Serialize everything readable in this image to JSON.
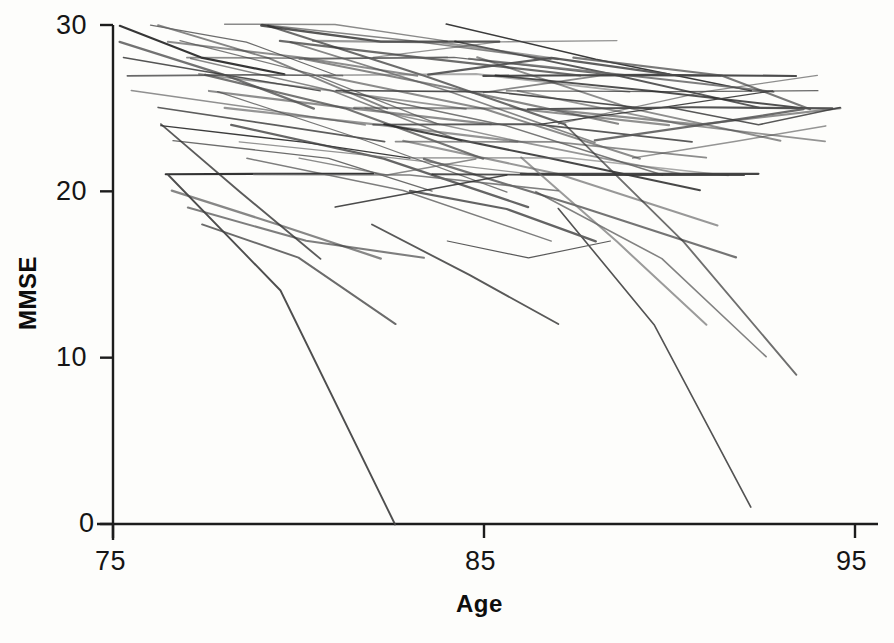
{
  "figure": {
    "background_color": "#fdfdfb",
    "line_color": "#3a3a3a"
  },
  "axes": {
    "x_title": "Age",
    "y_title": "MMSE",
    "x_ticks": [
      "75",
      "85",
      "95"
    ],
    "y_ticks": [
      "30",
      "20",
      "10",
      "0"
    ]
  },
  "chart_data": {
    "type": "line",
    "title": "",
    "subtitle": "",
    "xlabel": "Age",
    "ylabel": "MMSE",
    "xlim": [
      75,
      95
    ],
    "ylim": [
      0,
      30
    ],
    "xticks": [
      75,
      85,
      95
    ],
    "yticks": [
      0,
      10,
      20,
      30
    ],
    "grid": false,
    "legend": "none",
    "n_series": 80,
    "series": [
      {
        "name": "s1",
        "x": [
          75.2,
          77.4,
          79.6
        ],
        "values": [
          30,
          28,
          27
        ]
      },
      {
        "name": "s2",
        "x": [
          75.2,
          78.0,
          80.4
        ],
        "values": [
          29,
          27,
          25
        ]
      },
      {
        "name": "s3",
        "x": [
          75.3,
          77.9,
          80.6
        ],
        "values": [
          28,
          27,
          26
        ]
      },
      {
        "name": "s4",
        "x": [
          75.4,
          78.6,
          81.2
        ],
        "values": [
          27,
          27,
          27
        ]
      },
      {
        "name": "s5",
        "x": [
          75.5,
          79.0,
          81.8
        ],
        "values": [
          26,
          25,
          24
        ]
      },
      {
        "name": "s6",
        "x": [
          76.2,
          79.4,
          82.3
        ],
        "values": [
          25,
          24,
          23
        ]
      },
      {
        "name": "s7",
        "x": [
          76.3,
          80.1,
          83.0
        ],
        "values": [
          24,
          23,
          22
        ]
      },
      {
        "name": "s8",
        "x": [
          76.6,
          80.8,
          83.6
        ],
        "values": [
          23,
          22,
          20
        ]
      },
      {
        "name": "s9",
        "x": [
          76.4,
          79.6,
          82.0
        ],
        "values": [
          21,
          21,
          21
        ]
      },
      {
        "name": "s10",
        "x": [
          76.0,
          78.6,
          81.0
        ],
        "values": [
          30,
          29,
          27
        ]
      },
      {
        "name": "s11",
        "x": [
          76.2,
          79.2,
          82.4
        ],
        "values": [
          30,
          28,
          25
        ]
      },
      {
        "name": "s12",
        "x": [
          76.5,
          80.0,
          83.2
        ],
        "values": [
          29,
          28,
          27
        ]
      },
      {
        "name": "s13",
        "x": [
          76.8,
          80.4,
          83.8
        ],
        "values": [
          29,
          27,
          24
        ]
      },
      {
        "name": "s14",
        "x": [
          77.0,
          80.6,
          84.0
        ],
        "values": [
          28,
          28,
          28
        ]
      },
      {
        "name": "s15",
        "x": [
          77.1,
          80.9,
          84.4
        ],
        "values": [
          28,
          26,
          23
        ]
      },
      {
        "name": "s16",
        "x": [
          77.3,
          81.0,
          84.5
        ],
        "values": [
          27,
          26,
          25
        ]
      },
      {
        "name": "s17",
        "x": [
          77.5,
          81.3,
          85.0
        ],
        "values": [
          27,
          25,
          22
        ]
      },
      {
        "name": "s18",
        "x": [
          77.6,
          81.5,
          85.2
        ],
        "values": [
          26,
          25,
          24
        ]
      },
      {
        "name": "s19",
        "x": [
          77.8,
          81.8,
          85.6
        ],
        "values": [
          26,
          23,
          20
        ]
      },
      {
        "name": "s20",
        "x": [
          78.0,
          82.0,
          85.9
        ],
        "values": [
          25,
          24,
          23
        ]
      },
      {
        "name": "s21",
        "x": [
          78.2,
          82.3,
          86.2
        ],
        "values": [
          24,
          22,
          19
        ]
      },
      {
        "name": "s22",
        "x": [
          78.4,
          82.6,
          86.5
        ],
        "values": [
          23,
          22,
          21
        ]
      },
      {
        "name": "s23",
        "x": [
          78.6,
          82.8,
          86.8
        ],
        "values": [
          22,
          20,
          17
        ]
      },
      {
        "name": "s24",
        "x": [
          78.8,
          83.0,
          87.0
        ],
        "values": [
          21,
          21,
          20
        ]
      },
      {
        "name": "s25",
        "x": [
          76.6,
          79.4,
          82.2
        ],
        "values": [
          20,
          18,
          16
        ]
      },
      {
        "name": "s26",
        "x": [
          77.0,
          80.2,
          83.4
        ],
        "values": [
          19,
          17,
          16
        ]
      },
      {
        "name": "s27",
        "x": [
          77.4,
          80.0,
          82.6
        ],
        "values": [
          18,
          16,
          12
        ]
      },
      {
        "name": "s28",
        "x": [
          76.5,
          79.5,
          82.6
        ],
        "values": [
          21,
          14,
          0
        ]
      },
      {
        "name": "s29",
        "x": [
          76.3,
          78.4,
          80.6
        ],
        "values": [
          24,
          20,
          16
        ]
      },
      {
        "name": "s30",
        "x": [
          79.0,
          83.0,
          86.8
        ],
        "values": [
          30,
          29,
          28
        ]
      },
      {
        "name": "s31",
        "x": [
          79.2,
          83.4,
          87.2
        ],
        "values": [
          30,
          27,
          24
        ]
      },
      {
        "name": "s32",
        "x": [
          79.5,
          83.6,
          87.6
        ],
        "values": [
          29,
          28,
          27
        ]
      },
      {
        "name": "s33",
        "x": [
          79.8,
          84.0,
          88.0
        ],
        "values": [
          29,
          26,
          23
        ]
      },
      {
        "name": "s34",
        "x": [
          80.0,
          84.2,
          88.2
        ],
        "values": [
          28,
          28,
          27
        ]
      },
      {
        "name": "s35",
        "x": [
          80.2,
          84.5,
          88.6
        ],
        "values": [
          28,
          26,
          24
        ]
      },
      {
        "name": "s36",
        "x": [
          80.5,
          84.8,
          88.9
        ],
        "values": [
          27,
          27,
          26
        ]
      },
      {
        "name": "s37",
        "x": [
          80.7,
          85.0,
          89.2
        ],
        "values": [
          27,
          25,
          22
        ]
      },
      {
        "name": "s38",
        "x": [
          81.0,
          85.3,
          89.5
        ],
        "values": [
          26,
          26,
          25
        ]
      },
      {
        "name": "s39",
        "x": [
          81.2,
          85.6,
          89.8
        ],
        "values": [
          26,
          24,
          21
        ]
      },
      {
        "name": "s40",
        "x": [
          81.5,
          85.8,
          90.0
        ],
        "values": [
          25,
          25,
          24
        ]
      },
      {
        "name": "s41",
        "x": [
          81.8,
          86.0,
          90.3
        ],
        "values": [
          25,
          23,
          21
        ]
      },
      {
        "name": "s42",
        "x": [
          82.0,
          86.4,
          90.6
        ],
        "values": [
          24,
          24,
          23
        ]
      },
      {
        "name": "s43",
        "x": [
          82.3,
          86.6,
          90.8
        ],
        "values": [
          24,
          22,
          20
        ]
      },
      {
        "name": "s44",
        "x": [
          82.6,
          86.9,
          91.0
        ],
        "values": [
          23,
          23,
          22
        ]
      },
      {
        "name": "s45",
        "x": [
          82.8,
          87.0,
          91.3
        ],
        "values": [
          23,
          21,
          18
        ]
      },
      {
        "name": "s46",
        "x": [
          83.0,
          87.3,
          91.6
        ],
        "values": [
          22,
          22,
          21
        ]
      },
      {
        "name": "s47",
        "x": [
          83.4,
          87.6,
          91.8
        ],
        "values": [
          22,
          19,
          16
        ]
      },
      {
        "name": "s48",
        "x": [
          83.6,
          87.8,
          92.0
        ],
        "values": [
          21,
          21,
          21
        ]
      },
      {
        "name": "s49",
        "x": [
          84.0,
          88.0,
          92.2
        ],
        "values": [
          30,
          28,
          26
        ]
      },
      {
        "name": "s50",
        "x": [
          84.2,
          88.4,
          92.4
        ],
        "values": [
          29,
          27,
          25
        ]
      },
      {
        "name": "s51",
        "x": [
          84.6,
          88.8,
          92.8
        ],
        "values": [
          28,
          27,
          26
        ]
      },
      {
        "name": "s52",
        "x": [
          84.8,
          89.0,
          93.0
        ],
        "values": [
          28,
          25,
          23
        ]
      },
      {
        "name": "s53",
        "x": [
          85.0,
          89.4,
          93.4
        ],
        "values": [
          27,
          27,
          27
        ]
      },
      {
        "name": "s54",
        "x": [
          85.3,
          89.6,
          93.6
        ],
        "values": [
          27,
          26,
          25
        ]
      },
      {
        "name": "s55",
        "x": [
          85.6,
          90.0,
          94.0
        ],
        "values": [
          26,
          26,
          26
        ]
      },
      {
        "name": "s56",
        "x": [
          85.9,
          90.3,
          94.2
        ],
        "values": [
          26,
          24,
          23
        ]
      },
      {
        "name": "s57",
        "x": [
          86.2,
          90.6,
          94.4
        ],
        "values": [
          25,
          25,
          25
        ]
      },
      {
        "name": "s58",
        "x": [
          86.6,
          90.8,
          94.6
        ],
        "values": [
          25,
          24,
          25
        ]
      },
      {
        "name": "s59",
        "x": [
          87.0,
          91.0,
          94.0
        ],
        "values": [
          24,
          26,
          27
        ]
      },
      {
        "name": "s60",
        "x": [
          87.4,
          91.4,
          93.8
        ],
        "values": [
          28,
          27,
          25
        ]
      },
      {
        "name": "s61",
        "x": [
          86.0,
          89.4,
          92.4
        ],
        "values": [
          21,
          21,
          21
        ]
      },
      {
        "name": "s62",
        "x": [
          86.4,
          89.8,
          92.6
        ],
        "values": [
          20,
          16,
          10
        ]
      },
      {
        "name": "s63",
        "x": [
          86.0,
          88.6,
          91.0
        ],
        "values": [
          22,
          17,
          12
        ]
      },
      {
        "name": "s64",
        "x": [
          87.0,
          89.6,
          92.2
        ],
        "values": [
          19,
          12,
          1
        ]
      },
      {
        "name": "s65",
        "x": [
          87.2,
          90.4,
          93.4
        ],
        "values": [
          24,
          17,
          9
        ]
      },
      {
        "name": "s66",
        "x": [
          82.0,
          84.6,
          87.0
        ],
        "values": [
          18,
          15,
          12
        ]
      },
      {
        "name": "s67",
        "x": [
          83.0,
          85.6,
          88.0
        ],
        "values": [
          20,
          19,
          17
        ]
      },
      {
        "name": "s68",
        "x": [
          84.0,
          86.2,
          88.4
        ],
        "values": [
          17,
          16,
          17
        ]
      },
      {
        "name": "s69",
        "x": [
          80.0,
          82.4,
          84.8
        ],
        "values": [
          22,
          21,
          22
        ]
      },
      {
        "name": "s70",
        "x": [
          81.0,
          83.4,
          85.6
        ],
        "values": [
          19,
          20,
          21
        ]
      },
      {
        "name": "s71",
        "x": [
          78.0,
          81.0,
          84.0
        ],
        "values": [
          30,
          30,
          29
        ]
      },
      {
        "name": "s72",
        "x": [
          79.0,
          82.2,
          85.4
        ],
        "values": [
          30,
          29,
          29
        ]
      },
      {
        "name": "s73",
        "x": [
          80.4,
          83.8,
          87.0
        ],
        "values": [
          29,
          29,
          28
        ]
      },
      {
        "name": "s74",
        "x": [
          82.0,
          85.4,
          88.6
        ],
        "values": [
          28,
          29,
          29
        ]
      },
      {
        "name": "s75",
        "x": [
          83.5,
          86.8,
          90.0
        ],
        "values": [
          27,
          28,
          27
        ]
      },
      {
        "name": "s76",
        "x": [
          85.0,
          88.2,
          91.4
        ],
        "values": [
          26,
          27,
          27
        ]
      },
      {
        "name": "s77",
        "x": [
          86.5,
          89.8,
          92.8
        ],
        "values": [
          24,
          25,
          26
        ]
      },
      {
        "name": "s78",
        "x": [
          88.0,
          91.0,
          93.6
        ],
        "values": [
          23,
          24,
          25
        ]
      },
      {
        "name": "s79",
        "x": [
          89.0,
          91.8,
          94.2
        ],
        "values": [
          22,
          23,
          24
        ]
      },
      {
        "name": "s80",
        "x": [
          90.0,
          92.4,
          94.6
        ],
        "values": [
          25,
          24,
          25
        ]
      }
    ]
  },
  "geometry": {
    "px_x0": 113,
    "px_x1": 855,
    "age0": 75,
    "age1": 95,
    "px_y0": 524,
    "px_y1": 25,
    "mmse0": 0,
    "mmse1": 30
  }
}
